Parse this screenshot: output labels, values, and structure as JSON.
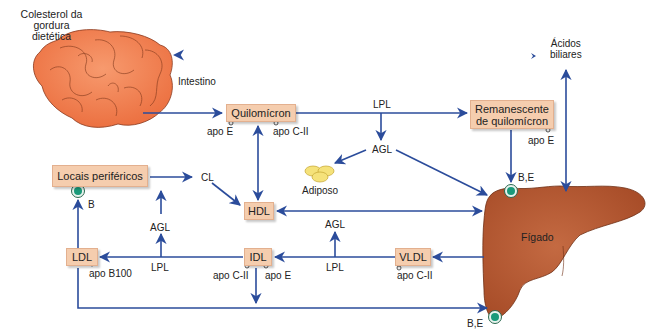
{
  "title_labels": {
    "dietary_cholesterol": "Colesterol da\ngordura dietética",
    "intestine": "Intestino",
    "bile_acids": "Ácidos\nbiliares",
    "liver": "Fígado",
    "adipose": "Adiposo"
  },
  "boxes": {
    "chylomicron": "Quilomícron",
    "chylomicron_remnant": "Remanescente\nde quilomícron",
    "peripheral_sites": "Locais periféricos",
    "hdl": "HDL",
    "ldl": "LDL",
    "idl": "IDL",
    "vldl": "VLDL"
  },
  "annotations": {
    "lpl_top": "LPL",
    "agl_top": "AGL",
    "cl": "CL",
    "agl_left": "AGL",
    "lpl_left": "LPL",
    "agl_mid": "AGL",
    "lpl_mid": "LPL",
    "apo_e_chylo": "apo E",
    "apo_cii_chylo": "apo C-II",
    "apo_e_remnant": "apo E",
    "apo_b100": "apo B100",
    "apo_cii_idl": "apo C-II",
    "apo_e_idl": "apo E",
    "apo_cii_vldl": "apo C-II",
    "receptor_b": "B",
    "receptor_be_top": "B,E",
    "receptor_be_bottom": "B,E"
  },
  "colors": {
    "arrow": "#2b4c9b",
    "box_fill": "#f5cdae",
    "intestine": "#f07a4a",
    "liver": "#b5532e",
    "receptor": "#1a9a7a",
    "adipose": "#f5e27a"
  }
}
